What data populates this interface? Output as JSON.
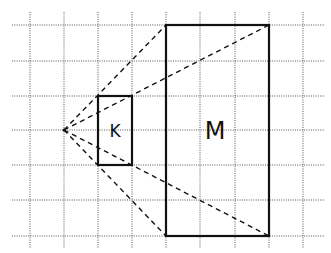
{
  "diagram": {
    "grid": {
      "x_lines": [
        30,
        64,
        98,
        132,
        166,
        200,
        235,
        269,
        303
      ],
      "y_lines": [
        25,
        61,
        96,
        130,
        165,
        200,
        236
      ],
      "x_extent": [
        12,
        325
      ],
      "y_extent": [
        12,
        248
      ],
      "color": "#555555"
    },
    "vertex": {
      "x": 64,
      "y": 130
    },
    "shapes": [
      {
        "label": "K",
        "x": 98,
        "y": 96,
        "width": 34,
        "height": 69,
        "label_x": 115,
        "label_y": 137,
        "font_size": 17
      },
      {
        "label": "M",
        "x": 166,
        "y": 25,
        "width": 103,
        "height": 211,
        "label_x": 215,
        "label_y": 139,
        "font_size": 24
      }
    ],
    "rays": [
      {
        "x2": 166,
        "y2": 25
      },
      {
        "x2": 269,
        "y2": 25
      },
      {
        "x2": 269,
        "y2": 236
      },
      {
        "x2": 166,
        "y2": 236
      }
    ],
    "stroke_color": "#111111"
  }
}
